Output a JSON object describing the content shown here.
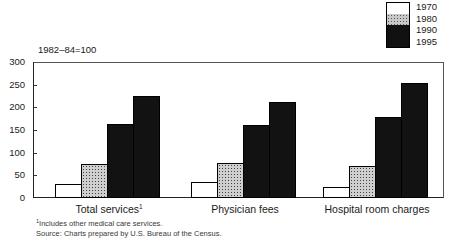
{
  "chart_data": {
    "type": "bar",
    "title": "",
    "subtitle": "",
    "index_note": "1982–84=100",
    "categories": [
      "Total services¹",
      "Physician fees",
      "Hospital room charges"
    ],
    "category_labels_plain": [
      "Total services",
      "Physician fees",
      "Hospital room charges"
    ],
    "series": [
      {
        "name": "1970",
        "values": [
          31,
          36,
          25
        ],
        "color": "#ffffff"
      },
      {
        "name": "1980",
        "values": [
          74,
          77,
          71
        ],
        "color": "#cfcfcf"
      },
      {
        "name": "1990",
        "values": [
          163,
          162,
          178
        ],
        "color": "#121212"
      },
      {
        "name": "1995",
        "values": [
          224,
          211,
          254
        ],
        "color": "#121212"
      }
    ],
    "xlabel": "",
    "ylabel": "",
    "ylim": [
      0,
      300
    ],
    "yticks": [
      0,
      50,
      100,
      150,
      200,
      250,
      300
    ],
    "ytick_labels": [
      "0",
      "50",
      "100",
      "150",
      "200",
      "250",
      "300"
    ],
    "grid": false,
    "legend_position": "top-right"
  },
  "legend": {
    "entries": [
      {
        "label": "1970",
        "swatch": "white"
      },
      {
        "label": "1980",
        "swatch": "gray"
      },
      {
        "label": "1990",
        "swatch": "black"
      },
      {
        "label": "1995",
        "swatch": "black"
      }
    ]
  },
  "footnotes": {
    "note": "¹Includes other medical care services.",
    "note_marker": "1",
    "note_text": "Includes other medical care services.",
    "source": "Source:  Charts prepared by U.S. Bureau of the Census."
  }
}
